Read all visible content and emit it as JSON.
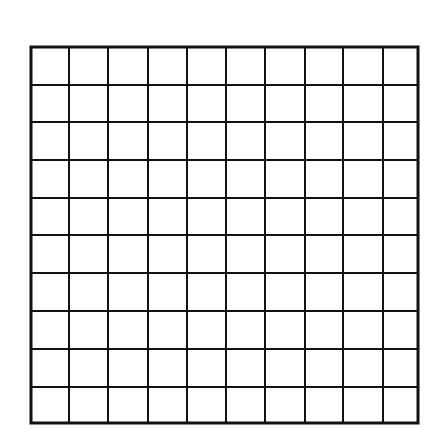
{
  "diagram": {
    "type": "grid",
    "rows": 10,
    "columns": 10,
    "line_color": "#111111",
    "background": "#ffffff",
    "bounds": {
      "left": 31,
      "top": 47,
      "right": 418,
      "bottom": 423
    },
    "column_lines": [
      31,
      69,
      108,
      148,
      187,
      226,
      265,
      305,
      343,
      383,
      418
    ],
    "row_lines": [
      47,
      85,
      122,
      160,
      198,
      235,
      273,
      311,
      349,
      387,
      423
    ],
    "outer_stroke_width": 3,
    "inner_stroke_width": 2
  }
}
